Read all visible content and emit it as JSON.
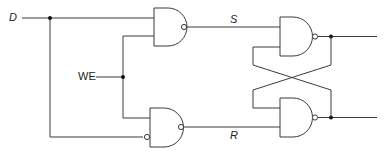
{
  "diagram": {
    "type": "circuit",
    "labels": {
      "d": "D",
      "we": "WE",
      "s": "S",
      "r": "R"
    },
    "components": [
      {
        "id": "nand-input-top",
        "type": "NAND",
        "inputs": [
          "D",
          "WE"
        ],
        "output": "S"
      },
      {
        "id": "nand-input-bottom",
        "type": "NAND",
        "inputs": [
          "WE",
          "NOT D"
        ],
        "output": "R"
      },
      {
        "id": "nand-latch-top",
        "type": "NAND",
        "inputs": [
          "S",
          "Q'"
        ],
        "output": "Q"
      },
      {
        "id": "nand-latch-bottom",
        "type": "NAND",
        "inputs": [
          "Q",
          "R"
        ],
        "output": "Q'"
      }
    ],
    "colors": {
      "line": "#3a3a3a",
      "junction": "#111111",
      "background": "#ffffff"
    }
  }
}
